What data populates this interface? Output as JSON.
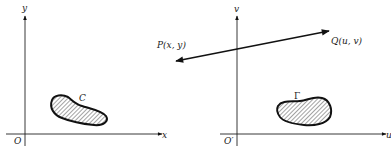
{
  "left_plane": {
    "x_axis_label": "x",
    "y_axis_label": "y",
    "origin_label": "O",
    "region_label": "C"
  },
  "right_plane": {
    "x_axis_label": "u",
    "y_axis_label": "v",
    "origin_label": "O′",
    "region_label": "Γ"
  },
  "mapping": {
    "source_point_label": "P(x, y)",
    "target_point_label": "Q(u, v)"
  }
}
